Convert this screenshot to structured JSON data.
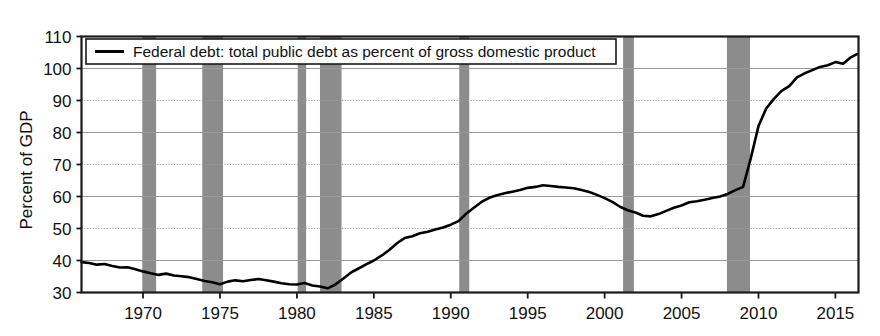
{
  "chart_data": {
    "type": "line",
    "title": "",
    "xlabel": "",
    "ylabel": "Percent of GDP",
    "xlim": [
      1966.0,
      2016.5
    ],
    "ylim": [
      30,
      110
    ],
    "yticks": [
      30,
      40,
      50,
      60,
      70,
      80,
      90,
      100,
      110
    ],
    "xticks": [
      1970,
      1975,
      1980,
      1985,
      1990,
      1995,
      2000,
      2005,
      2010,
      2015
    ],
    "grid": "horizontal",
    "legend_position": "top-left-inside",
    "legend": [
      "Federal debt: total public debt as percent of gross domestic product"
    ],
    "series": [
      {
        "name": "Federal debt: total public debt as percent of gross domestic product",
        "color": "#000000",
        "x": [
          1966.0,
          1966.5,
          1967.0,
          1967.5,
          1968.0,
          1968.5,
          1969.0,
          1969.5,
          1970.0,
          1970.5,
          1971.0,
          1971.5,
          1972.0,
          1972.5,
          1973.0,
          1973.5,
          1974.0,
          1974.5,
          1975.0,
          1975.5,
          1976.0,
          1976.5,
          1977.0,
          1977.5,
          1978.0,
          1978.5,
          1979.0,
          1979.5,
          1980.0,
          1980.5,
          1981.0,
          1981.5,
          1982.0,
          1982.5,
          1983.0,
          1983.5,
          1984.0,
          1984.5,
          1985.0,
          1985.5,
          1986.0,
          1986.5,
          1987.0,
          1987.5,
          1988.0,
          1988.5,
          1989.0,
          1989.5,
          1990.0,
          1990.5,
          1991.0,
          1991.5,
          1992.0,
          1992.5,
          1993.0,
          1993.5,
          1994.0,
          1994.5,
          1995.0,
          1995.5,
          1996.0,
          1996.5,
          1997.0,
          1997.5,
          1998.0,
          1998.5,
          1999.0,
          1999.5,
          2000.0,
          2000.5,
          2001.0,
          2001.5,
          2002.0,
          2002.5,
          2003.0,
          2003.5,
          2004.0,
          2004.5,
          2005.0,
          2005.5,
          2006.0,
          2006.5,
          2007.0,
          2007.5,
          2008.0,
          2008.5,
          2009.0,
          2009.5,
          2010.0,
          2010.5,
          2011.0,
          2011.5,
          2012.0,
          2012.5,
          2013.0,
          2013.5,
          2014.0,
          2014.5,
          2015.0,
          2015.5,
          2016.0,
          2016.4
        ],
        "y": [
          39.5,
          39.2,
          38.7,
          38.9,
          38.3,
          37.8,
          37.9,
          37.3,
          36.6,
          36.0,
          35.5,
          35.9,
          35.3,
          35.1,
          34.8,
          34.2,
          33.6,
          33.2,
          32.6,
          33.4,
          33.8,
          33.5,
          33.9,
          34.2,
          33.8,
          33.4,
          32.9,
          32.6,
          32.5,
          33.0,
          32.2,
          31.9,
          31.3,
          32.5,
          34.3,
          36.2,
          37.5,
          38.8,
          40.0,
          41.5,
          43.3,
          45.4,
          47.0,
          47.6,
          48.5,
          49.0,
          49.7,
          50.3,
          51.2,
          52.3,
          54.6,
          56.5,
          58.3,
          59.6,
          60.4,
          61.0,
          61.5,
          62.0,
          62.7,
          63.0,
          63.5,
          63.3,
          63.0,
          62.8,
          62.6,
          62.0,
          61.4,
          60.5,
          59.5,
          58.3,
          56.8,
          55.7,
          55.0,
          54.0,
          53.8,
          54.5,
          55.5,
          56.5,
          57.2,
          58.2,
          58.5,
          59.0,
          59.5,
          60.0,
          60.8,
          62.0,
          63.0,
          72.0,
          82.0,
          87.5,
          90.5,
          93.0,
          94.5,
          97.2,
          98.5,
          99.5,
          100.5,
          101.0,
          102.0,
          101.5,
          103.5,
          104.5
        ]
      }
    ],
    "recession_bands": [
      {
        "start": 1969.95,
        "end": 1970.85
      },
      {
        "start": 1973.85,
        "end": 1975.2
      },
      {
        "start": 1980.05,
        "end": 1980.6
      },
      {
        "start": 1981.5,
        "end": 1982.9
      },
      {
        "start": 1990.55,
        "end": 1991.2
      },
      {
        "start": 2001.2,
        "end": 2001.9
      },
      {
        "start": 2007.95,
        "end": 2009.45
      }
    ],
    "recession_band_color": "#8c8c8c",
    "line_color": "#000000",
    "gridline_color": "#9a9a9a",
    "frame_color": "#1a1a1a",
    "background_color": "#ffffff"
  },
  "legend": {
    "entry_label": "Federal debt: total public debt as percent of gross domestic product"
  },
  "axes": {
    "y_axis_title": "Percent of GDP",
    "y_tick_labels": [
      "110",
      "100",
      "90",
      "80",
      "70",
      "60",
      "50",
      "40",
      "30"
    ],
    "x_tick_labels": [
      "1970",
      "1975",
      "1980",
      "1985",
      "1990",
      "1995",
      "2000",
      "2005",
      "2010",
      "2015"
    ]
  }
}
